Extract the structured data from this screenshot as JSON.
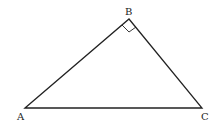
{
  "diagram": {
    "type": "right-triangle",
    "vertices": [
      {
        "name": "A",
        "label": "A",
        "x": 25,
        "y": 108
      },
      {
        "name": "B",
        "label": "B",
        "x": 129,
        "y": 19
      },
      {
        "name": "C",
        "label": "C",
        "x": 202,
        "y": 108
      }
    ],
    "right_angle_at": "B",
    "colors": {
      "stroke": "#222222",
      "background": "#ffffff"
    }
  }
}
